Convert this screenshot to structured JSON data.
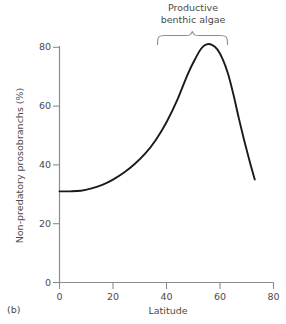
{
  "panel": {
    "label": "(b)"
  },
  "annotation": {
    "line1": "Productive",
    "line2": "benthic algae",
    "bracket": "curly-brace-down",
    "span_start": 37,
    "span_end": 63
  },
  "axes": {
    "x_title": "Latitude",
    "y_title": "Non-predatory prosobranchs (%)",
    "x_ticks": [
      "0",
      "20",
      "40",
      "60",
      "80"
    ],
    "y_ticks": [
      "0",
      "20",
      "40",
      "60",
      "80"
    ]
  },
  "colors": {
    "axis": "#8c8c8c",
    "curve": "#1a1a1a",
    "text": "#4a4a4a",
    "background": "#ffffff"
  },
  "chart_data": {
    "type": "line",
    "title": "",
    "subtitle": "",
    "xlabel": "Latitude",
    "ylabel": "Non-predatory prosobranchs (%)",
    "xlim": [
      0,
      80
    ],
    "ylim": [
      0,
      80
    ],
    "xticks": [
      0,
      20,
      40,
      60,
      80
    ],
    "yticks": [
      0,
      20,
      40,
      60,
      80
    ],
    "grid": false,
    "legend": false,
    "series": [
      {
        "name": "Non-predatory prosobranchs",
        "x": [
          0,
          4,
          8,
          12,
          16,
          20,
          24,
          28,
          32,
          36,
          40,
          44,
          48,
          51,
          53,
          55,
          57,
          59,
          61,
          63,
          65,
          67,
          69,
          71,
          73
        ],
        "values": [
          31,
          31,
          31.2,
          32,
          33.2,
          35,
          37.3,
          40.2,
          43.8,
          48.5,
          54.5,
          62,
          71,
          76.5,
          79.6,
          81,
          80.8,
          79.3,
          76,
          71,
          64,
          56,
          48.5,
          41.5,
          35
        ]
      }
    ],
    "annotations": [
      {
        "text": "Productive benthic algae",
        "type": "brace",
        "x_start": 37,
        "x_end": 63,
        "y": 80
      }
    ]
  }
}
